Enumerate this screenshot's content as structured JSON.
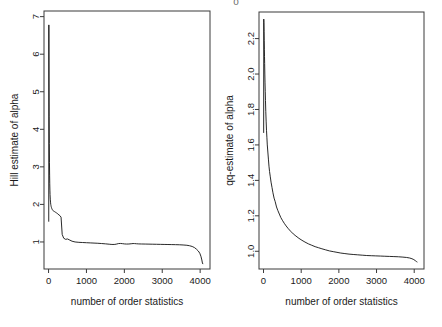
{
  "figure": {
    "background": "#ffffff",
    "line_color": "#111111",
    "axis_color": "#3a3a3a",
    "stray_mark": "o"
  },
  "chart_data": [
    {
      "id": "hill-plot",
      "type": "line",
      "title": "",
      "xlabel": "number of order statistics",
      "ylabel": "Hill estimate of alpha",
      "xlim": [
        -120,
        4260
      ],
      "ylim": [
        0.28,
        7.15
      ],
      "xticks": [
        0,
        1000,
        2000,
        3000,
        4000
      ],
      "xticklabels": [
        "0",
        "1000",
        "2000",
        "3000",
        "4000"
      ],
      "yticks": [
        1,
        2,
        3,
        4,
        5,
        6,
        7
      ],
      "yticklabels": [
        "1",
        "2",
        "3",
        "4",
        "5",
        "6",
        "7"
      ],
      "grid": false,
      "legend": "none",
      "series": [
        {
          "name": "Hill estimate",
          "x": [
            5,
            8,
            12,
            16,
            20,
            24,
            28,
            32,
            36,
            40,
            46,
            52,
            58,
            64,
            70,
            76,
            82,
            90,
            100,
            112,
            125,
            140,
            155,
            170,
            185,
            200,
            215,
            230,
            250,
            275,
            300,
            330,
            360,
            400,
            450,
            500,
            560,
            620,
            700,
            800,
            900,
            1000,
            1100,
            1200,
            1300,
            1400,
            1500,
            1600,
            1650,
            1700,
            1750,
            1800,
            1850,
            1900,
            1950,
            2000,
            2060,
            2120,
            2180,
            2230,
            2270,
            2320,
            2380,
            2450,
            2550,
            2650,
            2750,
            2850,
            2950,
            3050,
            3150,
            3250,
            3350,
            3450,
            3550,
            3650,
            3720,
            3790,
            3850,
            3900,
            3950,
            3990,
            4020,
            4045,
            4060,
            4070
          ],
          "y": [
            1.55,
            6.78,
            5.42,
            4.35,
            3.62,
            3.12,
            2.78,
            2.55,
            2.38,
            2.26,
            2.14,
            2.06,
            2.0,
            1.97,
            1.94,
            1.92,
            1.9,
            1.88,
            1.86,
            1.84,
            1.83,
            1.82,
            1.81,
            1.8,
            1.79,
            1.78,
            1.77,
            1.76,
            1.74,
            1.72,
            1.7,
            1.66,
            1.2,
            1.1,
            1.07,
            1.08,
            1.05,
            1.02,
            1.0,
            0.99,
            0.985,
            0.98,
            0.975,
            0.97,
            0.965,
            0.958,
            0.95,
            0.94,
            0.935,
            0.933,
            0.935,
            0.945,
            0.958,
            0.96,
            0.955,
            0.948,
            0.944,
            0.946,
            0.952,
            0.958,
            0.957,
            0.952,
            0.948,
            0.946,
            0.944,
            0.942,
            0.94,
            0.938,
            0.936,
            0.934,
            0.932,
            0.93,
            0.928,
            0.925,
            0.92,
            0.912,
            0.9,
            0.88,
            0.85,
            0.81,
            0.76,
            0.7,
            0.62,
            0.52,
            0.44,
            0.42
          ]
        }
      ]
    },
    {
      "id": "qq-plot",
      "type": "line",
      "title": "",
      "xlabel": "number of order statistics",
      "ylabel": "qq-estimate of alpha",
      "xlim": [
        -120,
        4260
      ],
      "ylim": [
        0.9,
        2.35
      ],
      "xticks": [
        0,
        1000,
        2000,
        3000,
        4000
      ],
      "xticklabels": [
        "0",
        "1000",
        "2000",
        "3000",
        "4000"
      ],
      "yticks": [
        1.0,
        1.2,
        1.4,
        1.6,
        1.8,
        2.0,
        2.2
      ],
      "yticklabels": [
        "1.0",
        "1.2",
        "1.4",
        "1.6",
        "1.8",
        "2.0",
        "2.2"
      ],
      "grid": false,
      "legend": "none",
      "series": [
        {
          "name": "qq-estimate",
          "x": [
            4,
            7,
            10,
            14,
            18,
            22,
            26,
            30,
            35,
            40,
            46,
            52,
            60,
            70,
            80,
            90,
            100,
            115,
            130,
            145,
            160,
            180,
            200,
            225,
            250,
            280,
            310,
            345,
            380,
            420,
            460,
            500,
            550,
            600,
            660,
            720,
            790,
            860,
            940,
            1020,
            1100,
            1190,
            1280,
            1370,
            1460,
            1550,
            1650,
            1750,
            1850,
            1950,
            2050,
            2160,
            2270,
            2380,
            2500,
            2620,
            2740,
            2860,
            2980,
            3100,
            3220,
            3340,
            3460,
            3580,
            3700,
            3800,
            3880,
            3940,
            3990,
            4030,
            4060,
            4075
          ],
          "y": [
            1.67,
            2.31,
            2.29,
            2.24,
            2.19,
            2.14,
            2.1,
            2.06,
            2.0,
            1.95,
            1.9,
            1.85,
            1.79,
            1.73,
            1.68,
            1.64,
            1.6,
            1.56,
            1.52,
            1.48,
            1.45,
            1.42,
            1.39,
            1.36,
            1.33,
            1.3,
            1.28,
            1.25,
            1.23,
            1.21,
            1.19,
            1.175,
            1.158,
            1.143,
            1.127,
            1.113,
            1.098,
            1.086,
            1.073,
            1.062,
            1.052,
            1.042,
            1.034,
            1.026,
            1.02,
            1.014,
            1.008,
            1.002,
            0.998,
            0.994,
            0.99,
            0.987,
            0.984,
            0.982,
            0.98,
            0.978,
            0.976,
            0.975,
            0.974,
            0.973,
            0.972,
            0.971,
            0.97,
            0.969,
            0.967,
            0.965,
            0.962,
            0.958,
            0.953,
            0.947,
            0.942,
            0.94
          ]
        }
      ]
    }
  ]
}
